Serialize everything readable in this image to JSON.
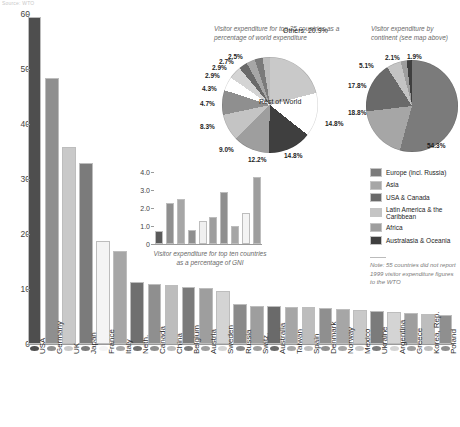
{
  "source_line": "Source: WTO",
  "chart_data": [
    {
      "type": "bar",
      "id": "main-bar-chart",
      "title": "",
      "xlabel": "",
      "ylabel": "",
      "ylim": [
        0,
        60
      ],
      "yticks": [
        0,
        10,
        20,
        30,
        40,
        50,
        60
      ],
      "grid": false,
      "categories": [
        "USA",
        "Germany",
        "UK",
        "Japan",
        "France",
        "Italy",
        "Neth.",
        "Canada",
        "China",
        "Belgium",
        "Austria",
        "Sweden",
        "Russia",
        "Switz.",
        "Australia",
        "Taiwan",
        "Spain",
        "Denmark",
        "Norway",
        "Mexico",
        "Ukraine",
        "Argentina",
        "Greece",
        "Korea, Rep.",
        "Poland"
      ],
      "values": [
        59.4,
        48.4,
        35.8,
        32.9,
        18.7,
        17.0,
        11.2,
        11.0,
        10.8,
        10.4,
        10.1,
        9.6,
        7.3,
        7.0,
        6.9,
        6.8,
        6.7,
        6.6,
        6.4,
        6.2,
        6.0,
        5.9,
        5.6,
        5.4,
        5.2
      ],
      "colors": [
        "#4e4e4e",
        "#8f8f8f",
        "#c9c9c9",
        "#7b7b7b",
        "#f4f4f4",
        "#a6a6a6",
        "#6f6f6f",
        "#8f8f8f",
        "#bdbdbd",
        "#7b7b7b",
        "#9e9e9e",
        "#d4d4d4",
        "#8a8a8a",
        "#9e9e9e",
        "#6a6a6a",
        "#a6a6a6",
        "#bdbdbd",
        "#8f8f8f",
        "#a6a6a6",
        "#c9c9c9",
        "#7b7b7b",
        "#d4d4d4",
        "#9e9e9e",
        "#bdbdbd",
        "#8f8f8f"
      ]
    },
    {
      "type": "bar",
      "id": "inset-gni-chart",
      "caption": "Visitor expenditure for top ten countries as a percentage of GNI",
      "ylim": [
        0,
        4.0
      ],
      "yticks": [
        "0",
        "1.0",
        "2.0",
        "3.0",
        "4.0"
      ],
      "categories": [
        "1",
        "2",
        "3",
        "4",
        "5",
        "6",
        "7",
        "8",
        "9",
        "10"
      ],
      "values": [
        0.7,
        2.3,
        2.5,
        0.8,
        1.3,
        1.5,
        2.9,
        1.0,
        1.7,
        3.7
      ],
      "colors": [
        "#5a5a5a",
        "#8f8f8f",
        "#a6a6a6",
        "#8f8f8f",
        "#f0f0f0",
        "#9e9e9e",
        "#8f8f8f",
        "#a6a6a6",
        "#f4f4f4",
        "#9e9e9e"
      ]
    },
    {
      "type": "pie",
      "id": "top25-share-pie",
      "title": "Visitor expenditure for top 25 countries as a percentage of world expenditure",
      "center_label": "Rest of World",
      "others_label": "Others: 20.9%",
      "labels": [
        "20.9%",
        "14.8%",
        "14.8%",
        "12.2%",
        "9.0%",
        "8.3%",
        "4.7%",
        "4.3%",
        "2.9%",
        "2.9%",
        "2.7%",
        "2.5%"
      ],
      "values": [
        20.9,
        14.8,
        14.8,
        12.2,
        9.0,
        8.3,
        4.7,
        4.3,
        2.9,
        2.9,
        2.7,
        2.5
      ],
      "colors": [
        "#c9c9c9",
        "#ffffff",
        "#3f3f3f",
        "#9e9e9e",
        "#c4c4c4",
        "#8f8f8f",
        "#ffffff",
        "#d4d4d4",
        "#6a6a6a",
        "#a6a6a6",
        "#7b7b7b",
        "#bdbdbd"
      ]
    },
    {
      "type": "pie",
      "id": "continent-share-pie",
      "title": "Visitor expenditure by continent (see map above)",
      "labels": [
        "54.3%",
        "18.8%",
        "17.8%",
        "5.1%",
        "2.1%",
        "1.9%"
      ],
      "values": [
        54.3,
        18.8,
        17.8,
        5.1,
        2.1,
        1.9
      ],
      "categories": [
        "Europe (incl. Russia)",
        "Asia",
        "USA & Canada",
        "Latin America & the Caribbean",
        "Africa",
        "Australasia & Oceania"
      ],
      "colors": [
        "#7b7b7b",
        "#a6a6a6",
        "#6a6a6a",
        "#c4c4c4",
        "#9e9e9e",
        "#3f3f3f"
      ]
    }
  ],
  "legend": {
    "items": [
      {
        "label": "Europe (incl. Russia)",
        "color": "#7b7b7b"
      },
      {
        "label": "Asia",
        "color": "#a6a6a6"
      },
      {
        "label": "USA & Canada",
        "color": "#6a6a6a"
      },
      {
        "label": "Latin America & the Caribbean",
        "color": "#c4c4c4"
      },
      {
        "label": "Africa",
        "color": "#9e9e9e"
      },
      {
        "label": "Australasia & Oceania",
        "color": "#3f3f3f"
      }
    ]
  },
  "note": "Note: 55 countries did not report 1999 visitor expenditure figures to the WTO"
}
